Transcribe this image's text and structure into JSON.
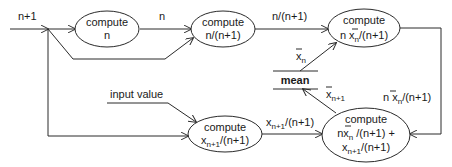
{
  "diagram": {
    "nodes": {
      "compute_n": {
        "line1": "compute",
        "line2": "n"
      },
      "compute_ratio": {
        "line1": "compute",
        "line2": "n/(n+1)"
      },
      "compute_scaled_mean": {
        "line1": "compute",
        "line2_pre": "n ",
        "line2_var": "x",
        "line2_sub": "n",
        "line2_post": "/(n+1)"
      },
      "compute_scaled_input": {
        "line1": "compute",
        "line2_var": "x",
        "line2_sub": "n+1",
        "line2_post": "/(n+1)"
      },
      "compute_new_mean": {
        "line1": "compute",
        "line2_pre": "n",
        "line2_var": "x",
        "line2_sub": "n",
        "line2_post": " /(n+1) +",
        "line3_var": "x",
        "line3_sub": "n+1",
        "line3_post": "/(n+1)"
      },
      "mean_store": {
        "label": "mean"
      }
    },
    "edge_labels": {
      "n_plus_1": "n+1",
      "n": "n",
      "ratio": "n/(n+1)",
      "xbar_n": {
        "var": "x",
        "sub": "n"
      },
      "xbar_n_plus_1": {
        "var": "x",
        "sub": "n+1"
      },
      "scaled_mean": {
        "pre": "n ",
        "var": "x",
        "sub": "n",
        "post": "/(n+1)"
      },
      "scaled_input": {
        "var": "x",
        "sub": "n+1",
        "post": "/(n+1)"
      },
      "input_value": "input value"
    }
  }
}
